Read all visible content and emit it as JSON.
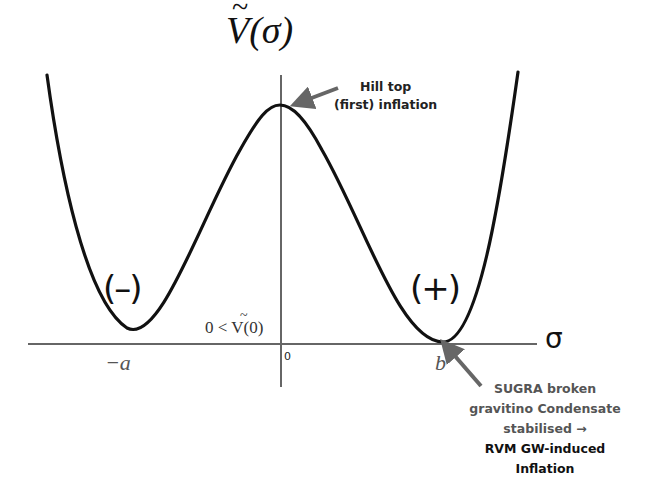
{
  "diagram": {
    "y_axis_label": "V(σ)",
    "y_axis_label_tilde": "~",
    "x_axis_label": "σ",
    "annotations": {
      "hilltop_line1": "Hill top",
      "hilltop_line2": "(first) inflation",
      "minus_region": "(–)",
      "plus_region": "(+)",
      "v0_condition": "0 < V(0)",
      "v0_tilde": "~",
      "sugra_line1": "SUGRA  broken",
      "sugra_line2": "gravitino  Condensate",
      "sugra_line3": "stabilised →",
      "rvm_line1": "RVM  GW-induced",
      "rvm_line2": "Inflation"
    },
    "ticks": {
      "zero": "0",
      "minus_a": "−a",
      "b": "b"
    },
    "colors": {
      "curve": "#111111",
      "axis": "#666666",
      "arrow": "#666666",
      "annotation_gray": "#555555",
      "annotation_dark": "#111111"
    },
    "curve_points": {
      "left_top": [
        47,
        75
      ],
      "left_min": [
        127,
        328
      ],
      "peak": [
        280,
        105
      ],
      "right_min": [
        443,
        342
      ],
      "right_top": [
        518,
        72
      ]
    }
  }
}
